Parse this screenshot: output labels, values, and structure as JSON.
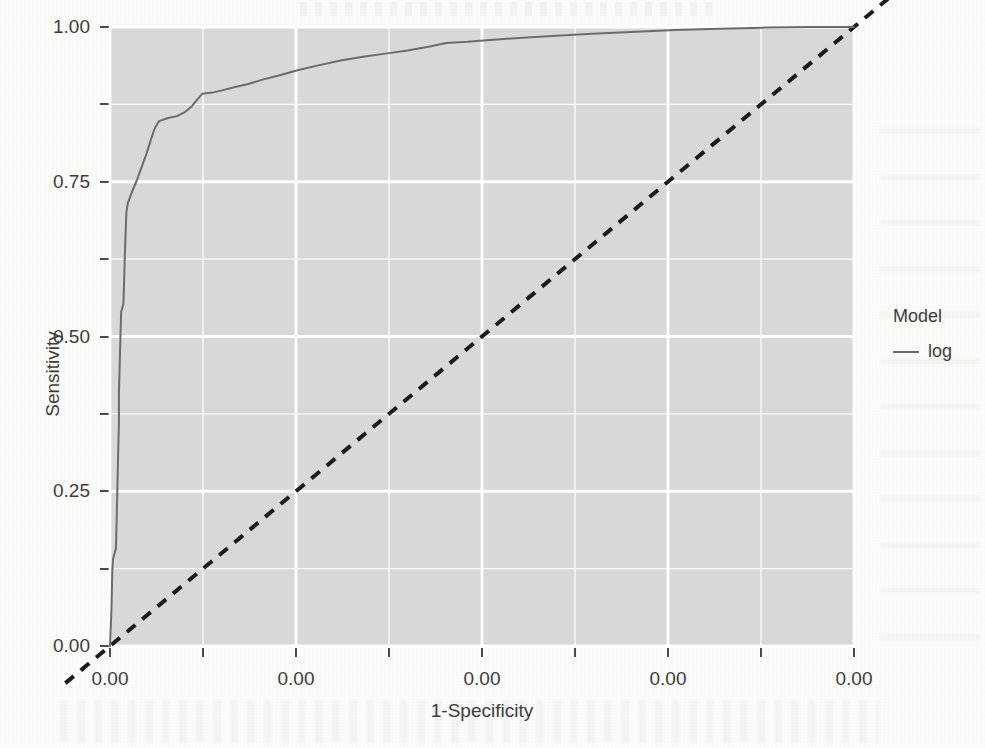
{
  "chart_data": {
    "type": "line",
    "title": "",
    "xlabel": "1-Specificity",
    "ylabel": "Sensitivity",
    "xlim": [
      0,
      1
    ],
    "ylim": [
      0,
      1
    ],
    "grid": true,
    "grid_color": "#ffffff",
    "panel_background": "#d8d8d8",
    "legend": {
      "title": "Model",
      "position": "right",
      "entries": [
        {
          "label": "log",
          "color": "#6b6b6b",
          "style": "solid"
        }
      ]
    },
    "x_tick_labels": [
      "0.00",
      "0.00",
      "0.00",
      "0.00",
      "0.00"
    ],
    "x_tick_positions": [
      0.0,
      0.25,
      0.5,
      0.75,
      1.0
    ],
    "y_tick_labels": [
      "0.00",
      "0.25",
      "0.50",
      "0.75",
      "1.00"
    ],
    "y_tick_positions": [
      0.0,
      0.25,
      0.5,
      0.75,
      1.0
    ],
    "x_minor_ticks": [
      0.125,
      0.375,
      0.625,
      0.875
    ],
    "y_minor_ticks": [
      0.125,
      0.375,
      0.625,
      0.875
    ],
    "series": [
      {
        "name": "log",
        "color": "#6b6b6b",
        "style": "solid",
        "width": 2,
        "points": [
          [
            0.0,
            0.0
          ],
          [
            0.002,
            0.06
          ],
          [
            0.003,
            0.118
          ],
          [
            0.004,
            0.14
          ],
          [
            0.008,
            0.158
          ],
          [
            0.009,
            0.205
          ],
          [
            0.01,
            0.258
          ],
          [
            0.011,
            0.312
          ],
          [
            0.012,
            0.362
          ],
          [
            0.012,
            0.408
          ],
          [
            0.013,
            0.452
          ],
          [
            0.014,
            0.498
          ],
          [
            0.015,
            0.54
          ],
          [
            0.018,
            0.552
          ],
          [
            0.019,
            0.59
          ],
          [
            0.02,
            0.632
          ],
          [
            0.021,
            0.668
          ],
          [
            0.022,
            0.7
          ],
          [
            0.024,
            0.716
          ],
          [
            0.03,
            0.735
          ],
          [
            0.036,
            0.752
          ],
          [
            0.042,
            0.772
          ],
          [
            0.049,
            0.795
          ],
          [
            0.055,
            0.818
          ],
          [
            0.06,
            0.836
          ],
          [
            0.066,
            0.848
          ],
          [
            0.078,
            0.853
          ],
          [
            0.09,
            0.856
          ],
          [
            0.1,
            0.862
          ],
          [
            0.11,
            0.872
          ],
          [
            0.118,
            0.884
          ],
          [
            0.124,
            0.892
          ],
          [
            0.138,
            0.894
          ],
          [
            0.152,
            0.898
          ],
          [
            0.168,
            0.903
          ],
          [
            0.186,
            0.908
          ],
          [
            0.205,
            0.915
          ],
          [
            0.228,
            0.922
          ],
          [
            0.252,
            0.93
          ],
          [
            0.28,
            0.938
          ],
          [
            0.31,
            0.946
          ],
          [
            0.34,
            0.952
          ],
          [
            0.37,
            0.957
          ],
          [
            0.4,
            0.962
          ],
          [
            0.428,
            0.968
          ],
          [
            0.452,
            0.974
          ],
          [
            0.48,
            0.976
          ],
          [
            0.52,
            0.98
          ],
          [
            0.56,
            0.983
          ],
          [
            0.6,
            0.986
          ],
          [
            0.648,
            0.989
          ],
          [
            0.7,
            0.992
          ],
          [
            0.76,
            0.995
          ],
          [
            0.82,
            0.997
          ],
          [
            0.88,
            0.999
          ],
          [
            0.94,
            1.0
          ],
          [
            1.0,
            1.0
          ]
        ]
      }
    ],
    "reference_line": {
      "name": "chance-diagonal",
      "style": "dashed",
      "color": "#1c1c1c",
      "width": 4,
      "from": [
        -0.06,
        -0.06
      ],
      "to": [
        1.06,
        1.06
      ]
    }
  }
}
